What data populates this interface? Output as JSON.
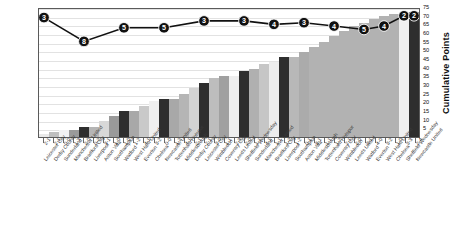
{
  "chart_data": {
    "type": "bar",
    "title": "",
    "xlabel": "",
    "ylabel": "Cumulative Points",
    "ylim": [
      0,
      75
    ],
    "ytick_step": 5,
    "yticks": [
      5,
      10,
      15,
      20,
      25,
      30,
      35,
      40,
      45,
      50,
      55,
      60,
      65,
      70,
      75
    ],
    "grid": true,
    "legend": "none",
    "categories": [
      "Leicester City",
      "Derby County",
      "Sunderland",
      "Manchester United",
      "Bradford City",
      "Liverpool",
      "Aston Villa",
      "Southampton",
      "Watford",
      "West Ham United",
      "Everton",
      "Chelsea",
      "Newcastle United",
      "Tottenham Hotspur",
      "Middlesbrough",
      "Derby County",
      "Leicester City",
      "Wimbledon",
      "Coventry City",
      "Leeds United",
      "Sheffield Wednesday",
      "Sunderland",
      "Manchester United",
      "Bradford City",
      "Liverpool",
      "Southampton",
      "Aston Villa",
      "Middlesbrough",
      "Tottenham Hotspur",
      "Coventry City",
      "Wimbledon",
      "Leeds United",
      "Watford",
      "Everton",
      "West Ham United",
      "Chelsea",
      "Sheffield Wednesday",
      "Newcastle United"
    ],
    "scores": [
      "2-1",
      "2-1",
      "0-0",
      "1-3",
      "2-0",
      "0-2",
      "3-1",
      "1-0",
      "1-0",
      "1-2",
      "4-1",
      "3-2",
      "0-0",
      "1-2",
      "4-1",
      "2-1",
      "2-1",
      "3-0",
      "1-1",
      "2-3",
      "2-0",
      "1-1",
      "4-1",
      "1-1",
      "1-2",
      "1-2",
      "0-1",
      "3-1",
      "1-1",
      "1-2",
      "2-1",
      "2-0",
      "3-1",
      "4-0",
      "3-2",
      "1-0",
      "3-3",
      "2-4"
    ],
    "values": [
      2,
      3,
      4,
      4,
      6,
      6,
      9,
      12,
      15,
      15,
      18,
      21,
      22,
      22,
      25,
      28,
      31,
      34,
      35,
      35,
      38,
      39,
      42,
      43,
      46,
      46,
      49,
      52,
      55,
      58,
      61,
      64,
      66,
      68,
      70,
      71,
      72,
      72
    ],
    "bar_shades": [
      "#e9e9e9",
      "#bfbfbf",
      "#f2f2f2",
      "#9a9a9a",
      "#2e2e2e",
      "#b5b5b5",
      "#d8d8d8",
      "#9a9a9a",
      "#2e2e2e",
      "#a8a8a8",
      "#c9c9c9",
      "#efefef",
      "#2e2e2e",
      "#a8a8a8",
      "#b5b5b5",
      "#d3d3d3",
      "#2e2e2e",
      "#bdbdbd",
      "#a0a0a0",
      "#eeeeee",
      "#2e2e2e",
      "#b0b0b0",
      "#c6c6c6",
      "#ededed",
      "#2e2e2e",
      "#b8b8b8",
      "#ababab",
      "#b2b2b2",
      "#b2b2b2",
      "#b2b2b2",
      "#b2b2b2",
      "#b2b2b2",
      "#b2b2b2",
      "#b2b2b2",
      "#b2b2b2",
      "#b2b2b2",
      "#f0f0f0",
      "#2e2e2e"
    ],
    "line": {
      "name": "Position",
      "marker_indices": [
        0,
        4,
        8,
        12,
        16,
        20,
        23,
        26,
        29,
        32,
        34,
        36,
        37
      ],
      "marker_labels": [
        "3",
        "8",
        "5",
        "5",
        "3",
        "3",
        "4",
        "3",
        "4",
        "5",
        "4",
        "2",
        "2"
      ],
      "marker_y": [
        70,
        56,
        64,
        64,
        68,
        68,
        66,
        67,
        65,
        63,
        65,
        71,
        71
      ]
    }
  },
  "axis": {
    "y_title": "Cumulative Points"
  }
}
